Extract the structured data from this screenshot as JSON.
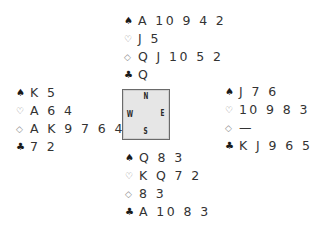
{
  "diagram": {
    "type": "bridge-deal",
    "suit_symbols": {
      "spades": "♠",
      "hearts": "♡",
      "diamonds": "◇",
      "clubs": "♣"
    },
    "compass": {
      "north": "N",
      "south": "S",
      "east": "E",
      "west": "W",
      "background_color": "#e6e6e6",
      "border_color": "#6a6a6a"
    },
    "hands": {
      "north": {
        "spades": "A 10 9 4 2",
        "hearts": "J 5",
        "diamonds": "Q J 10 5 2",
        "clubs": "Q"
      },
      "west": {
        "spades": "K 5",
        "hearts": "A 6 4",
        "diamonds": "A K 9 7 6 4",
        "clubs": "7 2"
      },
      "east": {
        "spades": "J 7 6",
        "hearts": "10 9 8 3",
        "diamonds": "—",
        "clubs": "K J 9 6 5 4"
      },
      "south": {
        "spades": "Q 8 3",
        "hearts": "K Q 7 2",
        "diamonds": "8 3",
        "clubs": "A 10 8 3"
      }
    }
  }
}
